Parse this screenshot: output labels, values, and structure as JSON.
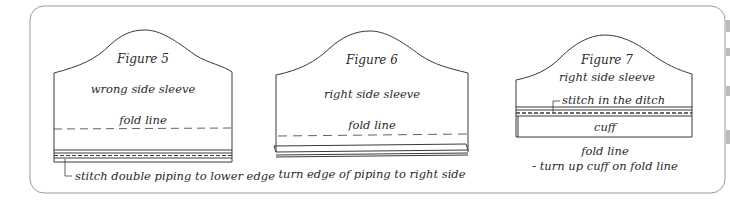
{
  "figures": [
    {
      "title": "Figure 5",
      "labels": [
        "wrong side sleeve",
        "fold line"
      ],
      "caption": "stitch double piping to lower edge"
    },
    {
      "title": "Figure 6",
      "labels": [
        "right side sleeve",
        "fold line"
      ],
      "caption": "turn edge of piping to right side"
    },
    {
      "title": "Figure 7",
      "labels": [
        "right side sleeve",
        "stitch in the ditch",
        "cuff"
      ],
      "caption": "fold line",
      "caption2": "- turn up cuff on fold line"
    }
  ],
  "colors": {
    "line": "#3a3a3a",
    "border": "#9a9a9a"
  }
}
